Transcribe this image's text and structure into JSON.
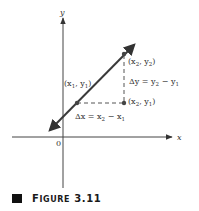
{
  "figure": {
    "axes": {
      "x_label": "x",
      "y_label": "y",
      "origin_label": "0"
    },
    "points": {
      "p1": {
        "label_main": "(x",
        "sub1": "1",
        "mid": ", y",
        "sub2": "1",
        "end": ")"
      },
      "p2": {
        "label_main": "(x",
        "sub1": "2",
        "mid": ", y",
        "sub2": "2",
        "end": ")"
      },
      "p3": {
        "label_main": "(x",
        "sub1": "2",
        "mid": ", y",
        "sub2": "1",
        "end": ")"
      }
    },
    "delta_x": {
      "text": "Δx = x",
      "sub_a": "2",
      "minus": " − x",
      "sub_b": "1"
    },
    "delta_y": {
      "text": "Δy = y",
      "sub_a": "2",
      "minus": " − y",
      "sub_b": "1"
    },
    "colors": {
      "line": "#3a3a3a",
      "axis": "#444444",
      "point": "#444444",
      "dashed": "#555555"
    }
  },
  "caption": {
    "first": "F",
    "rest": "IGURE",
    "number": " 3.11"
  }
}
